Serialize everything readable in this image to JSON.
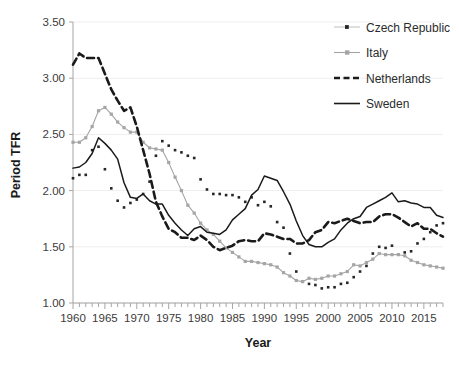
{
  "chart_data": {
    "type": "line",
    "title": "",
    "xlabel": "Year",
    "ylabel": "Period TFR",
    "xlim": [
      1960,
      2018
    ],
    "ylim": [
      1.0,
      3.5
    ],
    "ytick_step": 0.5,
    "ytick_labels": [
      "1.00",
      "1.50",
      "2.00",
      "2.50",
      "3.00",
      "3.50"
    ],
    "ytick_values": [
      1.0,
      1.5,
      2.0,
      2.5,
      3.0,
      3.5
    ],
    "xtick_labels": [
      "1960",
      "1965",
      "1970",
      "1975",
      "1980",
      "1985",
      "1990",
      "1995",
      "2000",
      "2005",
      "2010",
      "2015"
    ],
    "xtick_values": [
      1960,
      1965,
      1970,
      1975,
      1980,
      1985,
      1990,
      1995,
      2000,
      2005,
      2010,
      2015
    ],
    "xtick_minor_step": 1,
    "grid": "horizontal",
    "legend_position": "top-right",
    "x": [
      1960,
      1961,
      1962,
      1963,
      1964,
      1965,
      1966,
      1967,
      1968,
      1969,
      1970,
      1971,
      1972,
      1973,
      1974,
      1975,
      1976,
      1977,
      1978,
      1979,
      1980,
      1981,
      1982,
      1983,
      1984,
      1985,
      1986,
      1987,
      1988,
      1989,
      1990,
      1991,
      1992,
      1993,
      1994,
      1995,
      1996,
      1997,
      1998,
      1999,
      2000,
      2001,
      2002,
      2003,
      2004,
      2005,
      2006,
      2007,
      2008,
      2009,
      2010,
      2011,
      2012,
      2013,
      2014,
      2015,
      2016,
      2017,
      2018
    ],
    "series": [
      {
        "name": "Czech Republic",
        "color": "#262626",
        "style": "dotted-markers",
        "marker": "square",
        "values": [
          2.11,
          2.14,
          2.14,
          2.36,
          2.39,
          2.19,
          2.02,
          1.91,
          1.85,
          1.89,
          1.92,
          1.97,
          2.08,
          2.31,
          2.44,
          2.4,
          2.36,
          2.34,
          2.31,
          2.29,
          2.1,
          2.01,
          1.97,
          1.97,
          1.96,
          1.96,
          1.94,
          1.9,
          1.94,
          1.87,
          1.9,
          1.86,
          1.72,
          1.67,
          1.44,
          1.28,
          1.19,
          1.17,
          1.16,
          1.13,
          1.14,
          1.14,
          1.17,
          1.18,
          1.23,
          1.28,
          1.33,
          1.44,
          1.5,
          1.49,
          1.51,
          1.43,
          1.45,
          1.46,
          1.53,
          1.57,
          1.63,
          1.69,
          1.71
        ]
      },
      {
        "name": "Italy",
        "color": "#a5a5a5",
        "style": "solid-markers",
        "marker": "square",
        "values": [
          2.43,
          2.43,
          2.47,
          2.57,
          2.71,
          2.74,
          2.68,
          2.61,
          2.56,
          2.52,
          2.52,
          2.43,
          2.38,
          2.37,
          2.36,
          2.25,
          2.12,
          2.0,
          1.87,
          1.8,
          1.71,
          1.65,
          1.61,
          1.55,
          1.49,
          1.45,
          1.41,
          1.37,
          1.37,
          1.36,
          1.35,
          1.34,
          1.32,
          1.27,
          1.24,
          1.2,
          1.19,
          1.22,
          1.21,
          1.22,
          1.24,
          1.24,
          1.26,
          1.28,
          1.34,
          1.33,
          1.36,
          1.39,
          1.44,
          1.43,
          1.43,
          1.43,
          1.42,
          1.38,
          1.36,
          1.34,
          1.33,
          1.32,
          1.31
        ]
      },
      {
        "name": "Netherlands",
        "color": "#1a1a1a",
        "style": "dashed",
        "marker": "none",
        "values": [
          3.12,
          3.22,
          3.18,
          3.18,
          3.18,
          3.04,
          2.9,
          2.8,
          2.71,
          2.74,
          2.57,
          2.36,
          2.15,
          1.9,
          1.77,
          1.66,
          1.63,
          1.58,
          1.58,
          1.56,
          1.6,
          1.56,
          1.5,
          1.47,
          1.49,
          1.51,
          1.55,
          1.56,
          1.55,
          1.55,
          1.62,
          1.61,
          1.59,
          1.57,
          1.57,
          1.53,
          1.53,
          1.56,
          1.63,
          1.65,
          1.72,
          1.71,
          1.73,
          1.75,
          1.73,
          1.71,
          1.72,
          1.72,
          1.77,
          1.79,
          1.79,
          1.76,
          1.72,
          1.68,
          1.71,
          1.66,
          1.66,
          1.62,
          1.59
        ]
      },
      {
        "name": "Sweden",
        "color": "#1a1a1a",
        "style": "solid",
        "marker": "none",
        "values": [
          2.2,
          2.21,
          2.25,
          2.33,
          2.47,
          2.42,
          2.36,
          2.28,
          2.07,
          1.94,
          1.93,
          1.97,
          1.91,
          1.88,
          1.88,
          1.78,
          1.71,
          1.65,
          1.6,
          1.66,
          1.68,
          1.63,
          1.62,
          1.61,
          1.65,
          1.74,
          1.79,
          1.84,
          1.96,
          2.01,
          2.13,
          2.11,
          2.09,
          1.99,
          1.88,
          1.73,
          1.6,
          1.52,
          1.5,
          1.5,
          1.54,
          1.57,
          1.65,
          1.71,
          1.75,
          1.77,
          1.85,
          1.88,
          1.91,
          1.94,
          1.98,
          1.9,
          1.91,
          1.89,
          1.88,
          1.85,
          1.85,
          1.78,
          1.76
        ]
      }
    ]
  }
}
